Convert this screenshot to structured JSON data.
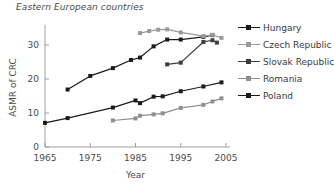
{
  "chart_data": {
    "type": "line",
    "title": "Eastern European countries",
    "xlabel": "Year",
    "ylabel": "ASMR of CRC",
    "xlim": [
      1965,
      2005
    ],
    "ylim": [
      0,
      35
    ],
    "xticks": [
      1965,
      1975,
      1985,
      1995,
      2005
    ],
    "yticks": [
      0,
      10,
      20,
      30
    ],
    "grid": false,
    "legend_position": "right",
    "series": [
      {
        "name": "Hungary",
        "color": "#1a1a1a",
        "marker": "square",
        "points": [
          [
            1970,
            16.9
          ],
          [
            1975,
            20.9
          ],
          [
            1980,
            23.2
          ],
          [
            1984,
            25.6
          ],
          [
            1986,
            26.3
          ],
          [
            1989,
            29.6
          ],
          [
            1992,
            31.6
          ],
          [
            1995,
            31.6
          ],
          [
            2000,
            32.4
          ],
          [
            2002,
            32.9
          ]
        ]
      },
      {
        "name": "Czech Republic",
        "color": "#9a9a9a",
        "marker": "square",
        "points": [
          [
            1986,
            33.5
          ],
          [
            1988,
            34.1
          ],
          [
            1990,
            34.5
          ],
          [
            1992,
            34.6
          ],
          [
            1995,
            33.7
          ],
          [
            2000,
            32.6
          ],
          [
            2002,
            33.0
          ],
          [
            2004,
            32.1
          ]
        ]
      },
      {
        "name": "Slovak Republic",
        "color": "#3d3d3d",
        "marker": "square",
        "points": [
          [
            1992,
            24.3
          ],
          [
            1995,
            24.8
          ],
          [
            2000,
            30.9
          ],
          [
            2002,
            31.4
          ],
          [
            2003,
            30.7
          ]
        ]
      },
      {
        "name": "Romania",
        "color": "#8f8f8f",
        "marker": "square",
        "points": [
          [
            1980,
            7.8
          ],
          [
            1985,
            8.4
          ],
          [
            1986,
            9.2
          ],
          [
            1989,
            9.6
          ],
          [
            1991,
            9.9
          ],
          [
            1995,
            11.5
          ],
          [
            2000,
            12.4
          ],
          [
            2002,
            13.4
          ],
          [
            2004,
            14.3
          ]
        ]
      },
      {
        "name": "Poland",
        "color": "#1a1a1a",
        "marker": "square",
        "points": [
          [
            1965,
            7.1
          ],
          [
            1970,
            8.5
          ],
          [
            1980,
            11.6
          ],
          [
            1985,
            13.7
          ],
          [
            1986,
            12.9
          ],
          [
            1989,
            14.8
          ],
          [
            1991,
            14.9
          ],
          [
            1995,
            16.4
          ],
          [
            2000,
            17.8
          ],
          [
            2004,
            19.0
          ]
        ]
      }
    ]
  },
  "legend": {
    "items": [
      {
        "label": "Hungary",
        "color": "#1a1a1a"
      },
      {
        "label": "Czech Republic",
        "color": "#9a9a9a"
      },
      {
        "label": "Slovak Republic",
        "color": "#3d3d3d"
      },
      {
        "label": "Romania",
        "color": "#8f8f8f"
      },
      {
        "label": "Poland",
        "color": "#1a1a1a"
      }
    ]
  },
  "axes": {
    "xtick_labels": [
      "1965",
      "1975",
      "1985",
      "1995",
      "2005"
    ],
    "ytick_labels": [
      "0",
      "10",
      "20",
      "30"
    ],
    "xlabel": "Year",
    "ylabel": "ASMR of CRC"
  }
}
